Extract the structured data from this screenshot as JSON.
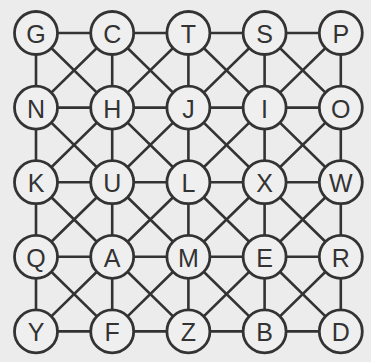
{
  "grid": {
    "rows": [
      [
        "G",
        "C",
        "T",
        "S",
        "P"
      ],
      [
        "N",
        "H",
        "J",
        "I",
        "O"
      ],
      [
        "K",
        "U",
        "L",
        "X",
        "W"
      ],
      [
        "Q",
        "A",
        "M",
        "E",
        "R"
      ],
      [
        "Y",
        "F",
        "Z",
        "B",
        "D"
      ]
    ],
    "connections": "each node connects to horizontal, vertical and diagonal neighbors",
    "colors": {
      "background": "#ececec",
      "line": "#333333",
      "node_fill": "#efefef"
    }
  }
}
